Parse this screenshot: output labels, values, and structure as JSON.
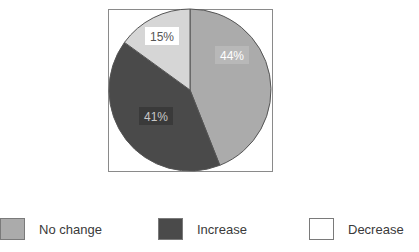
{
  "chart_data": {
    "type": "pie",
    "title": "",
    "slices": [
      {
        "label": "No change",
        "value": 44,
        "display": "44%",
        "color": "#ababab"
      },
      {
        "label": "Increase",
        "value": 41,
        "display": "41%",
        "color": "#4a4a4a"
      },
      {
        "label": "Decrease",
        "value": 15,
        "display": "15%",
        "color": "#d6d6d6"
      }
    ],
    "legend": {
      "position": "bottom",
      "entries": [
        {
          "label": "No change",
          "color": "#ababab"
        },
        {
          "label": "Increase",
          "color": "#4a4a4a"
        },
        {
          "label": "Decrease",
          "color": "#ffffff"
        }
      ]
    }
  }
}
